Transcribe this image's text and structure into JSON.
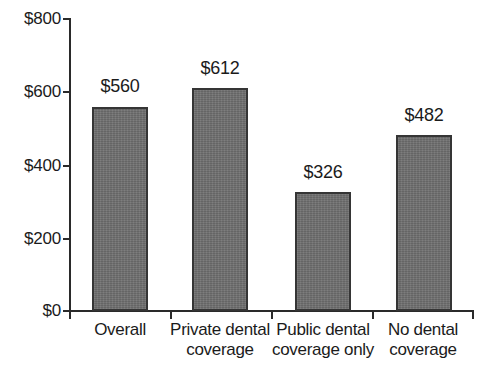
{
  "chart_data": {
    "type": "bar",
    "title": "",
    "subtitle": "",
    "xlabel": "",
    "ylabel": "",
    "categories": [
      "Overall",
      "Private dental coverage",
      "Public dental coverage only",
      "No dental coverage"
    ],
    "category_lines": [
      [
        "Overall",
        ""
      ],
      [
        "Private dental",
        "coverage"
      ],
      [
        "Public dental",
        "coverage only"
      ],
      [
        "No dental",
        "coverage"
      ]
    ],
    "values": [
      560,
      612,
      326,
      482
    ],
    "value_labels": [
      "$560",
      "$612",
      "$326",
      "$482"
    ],
    "ylim": [
      0,
      800
    ],
    "yticks": [
      0,
      200,
      400,
      600,
      800
    ],
    "ytick_labels": [
      "$0",
      "$200",
      "$400",
      "$600",
      "$800"
    ],
    "grid": false,
    "legend": null,
    "bar_color": "#6f6f6f",
    "bar_border_color": "#353535",
    "axis_color": "#2a2a2a",
    "background_color": "#ffffff",
    "text_color": "#1b1b1b"
  }
}
